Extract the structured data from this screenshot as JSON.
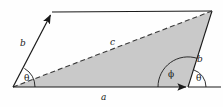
{
  "figure": {
    "type": "geometry-diagram",
    "background_color": "#fefefe",
    "shade_color": "#c9c9c9",
    "line_color": "#1a1a1a",
    "labels": {
      "b_left": "b",
      "b_right": "b",
      "c": "c",
      "a": "a",
      "theta_left": "θ",
      "theta_right": "θ",
      "phi": "ϕ"
    },
    "geometry": {
      "origin": [
        13,
        87
      ],
      "top_left_tip": [
        52,
        12
      ],
      "top_right": [
        212,
        11
      ],
      "bottom_right": [
        188,
        87
      ],
      "right_line_end": [
        221,
        87
      ],
      "vectors": [
        {
          "name": "b-left",
          "from": [
            13,
            87
          ],
          "to": [
            52,
            12
          ],
          "arrow": true,
          "style": "solid"
        },
        {
          "name": "a",
          "from": [
            13,
            87
          ],
          "to": [
            188,
            87
          ],
          "arrow": true,
          "style": "solid"
        },
        {
          "name": "c",
          "from": [
            13,
            87
          ],
          "to": [
            212,
            11
          ],
          "arrow": false,
          "style": "dashed"
        },
        {
          "name": "b-right",
          "from": [
            188,
            87
          ],
          "to": [
            212,
            11
          ],
          "arrow": false,
          "style": "solid"
        },
        {
          "name": "top-edge",
          "from": [
            52,
            12
          ],
          "to": [
            212,
            11
          ],
          "arrow": false,
          "style": "solid"
        },
        {
          "name": "baseline-extension",
          "from": [
            188,
            87
          ],
          "to": [
            221,
            87
          ],
          "arrow": false,
          "style": "solid"
        }
      ],
      "angles": [
        {
          "name": "theta-left",
          "vertex": [
            13,
            87
          ],
          "radius": 22
        },
        {
          "name": "phi",
          "vertex": [
            188,
            87
          ],
          "radius": 30
        },
        {
          "name": "theta-right",
          "vertex": [
            188,
            87
          ],
          "radius": 18
        }
      ],
      "shaded_triangle": [
        [
          13,
          87
        ],
        [
          212,
          11
        ],
        [
          188,
          87
        ]
      ]
    }
  }
}
